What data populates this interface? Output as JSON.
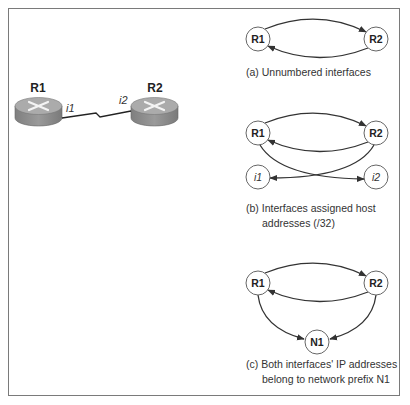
{
  "physical_topology": {
    "routers": [
      {
        "label": "R1",
        "interface": "i1"
      },
      {
        "label": "R2",
        "interface": "i2"
      }
    ],
    "link_type": "serial"
  },
  "diagram_a": {
    "nodes": [
      "R1",
      "R2"
    ],
    "caption": "(a) Unnumbered interfaces"
  },
  "diagram_b": {
    "nodes": [
      "R1",
      "R2",
      "i1",
      "i2"
    ],
    "caption_line1": "(b) Interfaces assigned host",
    "caption_line2": "addresses (/32)"
  },
  "diagram_c": {
    "nodes": [
      "R1",
      "R2",
      "N1"
    ],
    "caption_line1": "(c) Both interfaces' IP addresses",
    "caption_line2": "belong to network prefix N1"
  },
  "colors": {
    "border": "#7a7a7a",
    "router_top": "#a9a9a9",
    "router_side": "#8c8c8c",
    "edge": "#333333",
    "node_stroke": "#666666"
  }
}
